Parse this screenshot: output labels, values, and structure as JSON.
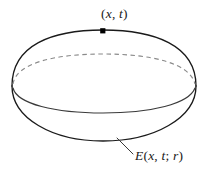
{
  "figure": {
    "kind": "math-diagram",
    "background_color": "#ffffff",
    "stroke_color": "#1a1a1a",
    "dashed_stroke_color": "#8a8a8a",
    "labels": {
      "point": {
        "full_text": "(x, t)",
        "open_paren": "(",
        "var_x": "x",
        "comma": ", ",
        "var_t": "t",
        "close_paren": ")"
      },
      "region": {
        "full_text": "E(x, t; r)",
        "var_e": "E",
        "open_paren": "(",
        "var_x": "x",
        "comma": ", ",
        "var_t": "t",
        "semicolon": "; ",
        "var_r": "r",
        "close_paren": ")"
      }
    },
    "markers": {
      "point_dot": {
        "label": "point-marker",
        "x": 103,
        "y": 31
      }
    },
    "geometry": {
      "outer_left_x": 12,
      "outer_right_x": 196,
      "top_y": 30,
      "bottom_y": 141,
      "equator_back_peak_y": 54,
      "equator_front_dip_y": 113,
      "center_x": 103
    }
  }
}
